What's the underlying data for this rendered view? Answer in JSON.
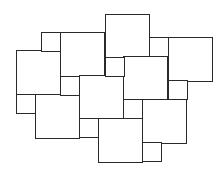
{
  "diagram": {
    "stroke_color": "#2a2a2a",
    "fill_color": "#ffffff",
    "stroke_width": 1,
    "large_squares": [
      {
        "id": "A",
        "x": 16,
        "y": 50,
        "size": 44
      },
      {
        "id": "B",
        "x": 60,
        "y": 32,
        "size": 44
      },
      {
        "id": "C",
        "x": 105,
        "y": 14,
        "size": 44
      },
      {
        "id": "D",
        "x": 168,
        "y": 37,
        "size": 44
      },
      {
        "id": "E",
        "x": 123,
        "y": 56,
        "size": 44
      },
      {
        "id": "F",
        "x": 79,
        "y": 75,
        "size": 44
      },
      {
        "id": "G",
        "x": 35,
        "y": 94,
        "size": 44
      },
      {
        "id": "H",
        "x": 142,
        "y": 99,
        "size": 44
      },
      {
        "id": "I",
        "x": 98,
        "y": 118,
        "size": 44
      }
    ],
    "small_squares": [
      {
        "id": "s1",
        "x": 41,
        "y": 32,
        "size": 19
      },
      {
        "id": "s2",
        "x": 149,
        "y": 37,
        "size": 19
      },
      {
        "id": "s3",
        "x": 105,
        "y": 57,
        "size": 19
      },
      {
        "id": "s4",
        "x": 60,
        "y": 76,
        "size": 19
      },
      {
        "id": "s5",
        "x": 168,
        "y": 80,
        "size": 19
      },
      {
        "id": "s6",
        "x": 16,
        "y": 94,
        "size": 19
      },
      {
        "id": "s7",
        "x": 123,
        "y": 99,
        "size": 19
      },
      {
        "id": "s8",
        "x": 79,
        "y": 118,
        "size": 19
      },
      {
        "id": "s9",
        "x": 142,
        "y": 142,
        "size": 19
      }
    ]
  },
  "caption": {
    "text": ""
  }
}
